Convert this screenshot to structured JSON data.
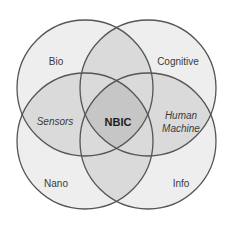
{
  "diagram": {
    "type": "venn-4",
    "colors": {
      "single_fill": "#eeeeee",
      "pair_fill": "#d9d9d9",
      "center_fill": "#c6c6c6",
      "outline": "#555555",
      "text": "#3a3a3a"
    },
    "sets": [
      {
        "id": "bio",
        "label": "Bio",
        "cx": 85,
        "cy": 88,
        "r": 68
      },
      {
        "id": "cognitive",
        "label": "Cognitive",
        "cx": 148,
        "cy": 88,
        "r": 68
      },
      {
        "id": "nano",
        "label": "Nano",
        "cx": 85,
        "cy": 141,
        "r": 68
      },
      {
        "id": "info",
        "label": "Info",
        "cx": 148,
        "cy": 141,
        "r": 68
      }
    ],
    "intersections": {
      "left": "Sensors",
      "center": "NBIC",
      "right_line1": "Human",
      "right_line2": "Machine"
    }
  }
}
